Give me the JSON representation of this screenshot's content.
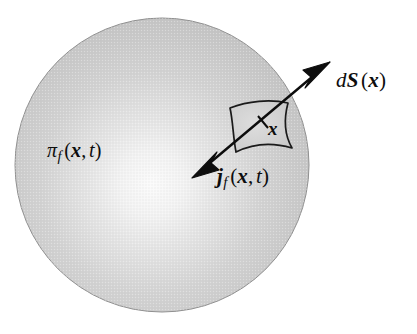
{
  "figure": {
    "background_color": "#ffffff",
    "width": 417,
    "height": 334
  },
  "sphere": {
    "name": "shaded-sphere",
    "center_x": 162,
    "center_y": 165,
    "radius": 147,
    "fill_light": "#f7f7f7",
    "fill_mid": "#c9c9c9",
    "fill_dark": "#a8a8a8",
    "edge_color": "#8f8f8f",
    "highlight_x": 152,
    "highlight_y": 188
  },
  "surface_patch": {
    "name": "surface-element-patch",
    "stroke_color": "#1a1a1a",
    "corners": [
      [
        230,
        108
      ],
      [
        288,
        103
      ],
      [
        292,
        148
      ],
      [
        236,
        152
      ]
    ]
  },
  "arrow": {
    "name": "double-headed-normal-arrow",
    "color": "#0d0d0d",
    "tail_point": [
      192,
      178
    ],
    "head_point": [
      330,
      62
    ],
    "midpoint": [
      263,
      122
    ],
    "tick_length": 11
  },
  "labels": {
    "surface_element": {
      "name": "dS-label",
      "d": "d",
      "S": "S",
      "open_paren": "(",
      "vector": "x",
      "close_paren": ")",
      "full_text": "dS (x)"
    },
    "density": {
      "name": "pi-f-label",
      "symbol": "π",
      "subscript": "f",
      "open_paren": "(",
      "vector": "x",
      "comma": ",",
      "time": "t",
      "close_paren": ")",
      "full_text": "π_f (x, t)"
    },
    "current": {
      "name": "j-f-label",
      "symbol": "j",
      "subscript": "f",
      "open_paren": "(",
      "vector": "x",
      "comma": ",",
      "time": "t",
      "close_paren": ")",
      "full_text": "j_f (x, t)"
    },
    "position": {
      "name": "x-position-label",
      "vector": "x",
      "full_text": "x"
    }
  }
}
